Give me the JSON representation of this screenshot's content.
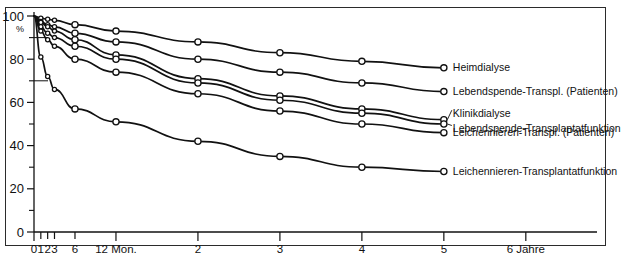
{
  "chart_data": {
    "type": "line",
    "title": "",
    "xlabel": "",
    "ylabel": "%",
    "xlim": [
      0,
      6.6
    ],
    "ylim": [
      0,
      100
    ],
    "grid": false,
    "legend_position": "right-inline",
    "y_unit": "%",
    "y_ticks": [
      0,
      20,
      40,
      60,
      80,
      100
    ],
    "y_tick_labels": [
      "0",
      "20",
      "40",
      "60",
      "80",
      "100"
    ],
    "y_minor_ticks": [
      10,
      30,
      50,
      70,
      90
    ],
    "x_ticks_years": [
      0,
      0.0833,
      0.1667,
      0.25,
      0.5,
      1,
      2,
      3,
      4,
      5,
      6
    ],
    "x_tick_labels": [
      "0",
      "1",
      "2",
      "3",
      "6",
      "12 Mon.",
      "2",
      "3",
      "4",
      "5",
      "6 Jahre"
    ],
    "x_axis_unit_note": "12 Mon.",
    "x_axis_unit_note2": "6 Jahre",
    "marker": "open-circle",
    "series": [
      {
        "name": "Heimdialyse",
        "label": "Heimdialyse",
        "x": [
          0,
          0.0833,
          0.1667,
          0.25,
          0.5,
          1,
          2,
          3,
          4,
          5
        ],
        "values": [
          100,
          99,
          98.5,
          98,
          96,
          93,
          88,
          83,
          79,
          76
        ]
      },
      {
        "name": "Lebendspende-Transpl. (Patienten)",
        "label": "Lebendspende-Transpl. (Patienten)",
        "x": [
          0,
          0.0833,
          0.1667,
          0.25,
          0.5,
          1,
          2,
          3,
          4,
          5
        ],
        "values": [
          100,
          97.5,
          96,
          95,
          92,
          88,
          80,
          74,
          69,
          65
        ]
      },
      {
        "name": "Klinikdialyse",
        "label": "Klinikdialyse",
        "x": [
          0,
          0.0833,
          0.1667,
          0.25,
          0.5,
          1,
          2,
          3,
          4,
          5
        ],
        "values": [
          100,
          97,
          95,
          93,
          89,
          82,
          71,
          63,
          57,
          52
        ]
      },
      {
        "name": "Lebendspende-Transplantatfunktion",
        "label": "Lebendspende-Transplantatfunktion",
        "x": [
          0,
          0.0833,
          0.1667,
          0.25,
          0.5,
          1,
          2,
          3,
          4,
          5
        ],
        "values": [
          100,
          95,
          92,
          90,
          86,
          80,
          69,
          61,
          55,
          50
        ]
      },
      {
        "name": "Leichennieren-Transpl. (Patienten)",
        "label": "Leichennieren-Transpl. (Patienten)",
        "x": [
          0,
          0.0833,
          0.1667,
          0.25,
          0.5,
          1,
          2,
          3,
          4,
          5
        ],
        "values": [
          100,
          93,
          89,
          86,
          80,
          74,
          64,
          56,
          50,
          46
        ]
      },
      {
        "name": "Leichennieren-Transplantatfunktion",
        "label": "Leichennieren-Transplantatfunktion",
        "x": [
          0,
          0.0833,
          0.1667,
          0.25,
          0.5,
          1,
          2,
          3,
          4,
          5
        ],
        "values": [
          100,
          81,
          72,
          66,
          57,
          51,
          42,
          35,
          30,
          28
        ]
      }
    ]
  },
  "axis": {
    "y_unit_label": "%"
  },
  "colors": {
    "line": "#111111",
    "marker_fill": "#ffffff",
    "frame": "#2b2b2b",
    "background": "#ffffff"
  }
}
